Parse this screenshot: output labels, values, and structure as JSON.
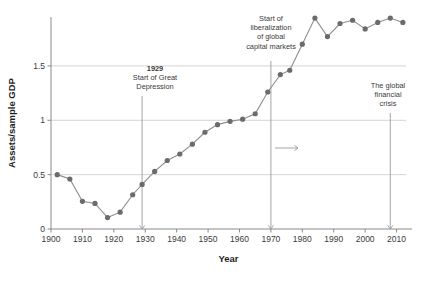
{
  "chart_data": {
    "type": "line",
    "title": "",
    "xlabel": "Year",
    "ylabel": "Assets/sample GDP",
    "xlim": [
      1900,
      2013
    ],
    "ylim": [
      0,
      1.95
    ],
    "grid": true,
    "legend": null,
    "x_ticks": [
      1900,
      1910,
      1920,
      1930,
      1940,
      1950,
      1960,
      1970,
      1980,
      1990,
      2000,
      2010
    ],
    "y_ticks": [
      0,
      0.5,
      1,
      1.5
    ],
    "y_tick_labels": [
      "0",
      "0.5",
      "1",
      "1.5"
    ],
    "series": [
      {
        "name": "Assets/sample GDP",
        "marker": "circle",
        "color": "#6b6b6b",
        "points": [
          {
            "x": 1902,
            "y": 0.5
          },
          {
            "x": 1906,
            "y": 0.46
          },
          {
            "x": 1910,
            "y": 0.255
          },
          {
            "x": 1914,
            "y": 0.235
          },
          {
            "x": 1918,
            "y": 0.105
          },
          {
            "x": 1922,
            "y": 0.155
          },
          {
            "x": 1926,
            "y": 0.315
          },
          {
            "x": 1929,
            "y": 0.41
          },
          {
            "x": 1933,
            "y": 0.53
          },
          {
            "x": 1937,
            "y": 0.63
          },
          {
            "x": 1941,
            "y": 0.69
          },
          {
            "x": 1945,
            "y": 0.78
          },
          {
            "x": 1949,
            "y": 0.89
          },
          {
            "x": 1953,
            "y": 0.96
          },
          {
            "x": 1957,
            "y": 0.99
          },
          {
            "x": 1961,
            "y": 1.01
          },
          {
            "x": 1965,
            "y": 1.06
          },
          {
            "x": 1969,
            "y": 1.26
          },
          {
            "x": 1973,
            "y": 1.42
          },
          {
            "x": 1976,
            "y": 1.46
          },
          {
            "x": 1980,
            "y": 1.7
          },
          {
            "x": 1984,
            "y": 1.94
          },
          {
            "x": 1988,
            "y": 1.77
          },
          {
            "x": 1992,
            "y": 1.89
          },
          {
            "x": 1996,
            "y": 1.92
          },
          {
            "x": 2000,
            "y": 1.84
          },
          {
            "x": 2004,
            "y": 1.9
          },
          {
            "x": 2008,
            "y": 1.94
          },
          {
            "x": 2012,
            "y": 1.9
          }
        ]
      }
    ],
    "annotations": [
      {
        "id": "great-depression",
        "x": 1929,
        "lines": [
          {
            "text": "1929",
            "bold": true
          },
          {
            "text": "Start of Great",
            "bold": false
          },
          {
            "text": "Depression",
            "bold": false
          }
        ],
        "pointer": "vertical-line-to-axis"
      },
      {
        "id": "capital-liberalization",
        "x": 1970,
        "lines": [
          {
            "text": "Start of",
            "bold": false
          },
          {
            "text": "liberalization",
            "bold": false
          },
          {
            "text": "of global",
            "bold": false
          },
          {
            "text": "capital markets",
            "bold": false
          }
        ],
        "pointer": "vertical-line-to-axis"
      },
      {
        "id": "global-financial-crisis",
        "x": 2008,
        "lines": [
          {
            "text": "The global",
            "bold": false
          },
          {
            "text": "financial",
            "bold": false
          },
          {
            "text": "crisis",
            "bold": false
          }
        ],
        "pointer": "vertical-line-to-axis"
      },
      {
        "id": "rightward-arrow",
        "type": "arrow",
        "direction": "right",
        "text": ""
      }
    ]
  }
}
